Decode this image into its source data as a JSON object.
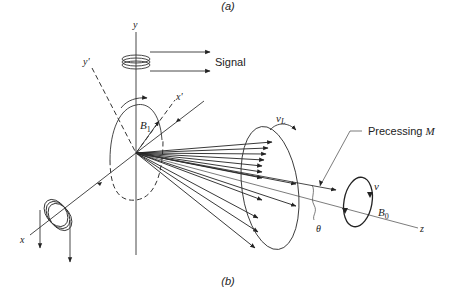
{
  "diagram": {
    "panel_top_label": "(a)",
    "panel_bottom_label": "(b)",
    "axes": {
      "y": "y",
      "y_prime": "y'",
      "x_prime": "x'",
      "x": "x",
      "z": "z"
    },
    "labels": {
      "signal": "Signal",
      "b1": "B",
      "b1_sub": "1",
      "vl": "v",
      "vl_sub": "L",
      "precessing": "Precessing ",
      "precessing_m": "M",
      "nu": "v",
      "b0": "B",
      "b0_sub": "0",
      "theta": "θ"
    }
  }
}
